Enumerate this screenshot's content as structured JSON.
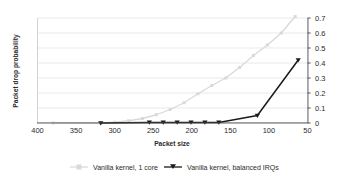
{
  "chart_data": {
    "type": "line",
    "title": "",
    "xlabel": "Packet size",
    "ylabel": "Packet drop probability",
    "xlim": [
      400,
      50
    ],
    "ylim": [
      0,
      0.7
    ],
    "x_ticks": [
      "400",
      "350",
      "300",
      "250",
      "200",
      "150",
      "100",
      "50"
    ],
    "x_tick_values": [
      400,
      350,
      300,
      250,
      200,
      150,
      100,
      50
    ],
    "y_ticks": [
      "0",
      "0.1",
      "0.2",
      "0.3",
      "0.4",
      "0.5",
      "0.6",
      "0.7"
    ],
    "y_tick_values": [
      0,
      0.1,
      0.2,
      0.3,
      0.4,
      0.5,
      0.6,
      0.7
    ],
    "x_axis_reversed": true,
    "y_axis_position": "right",
    "grid": "horizontal",
    "legend_position": "bottom",
    "series": [
      {
        "name": "Vanilla kernel, 1 core",
        "color": "#d9d9d9",
        "marker": "square",
        "x": [
          380,
          318,
          300,
          282,
          264,
          246,
          228,
          210,
          192,
          174,
          156,
          138,
          120,
          102,
          84,
          66
        ],
        "values": [
          0.0,
          0.0,
          0.005,
          0.015,
          0.03,
          0.055,
          0.09,
          0.135,
          0.195,
          0.25,
          0.3,
          0.37,
          0.45,
          0.52,
          0.6,
          0.71
        ]
      },
      {
        "name": "Vanilla kernel, balanced IRQs",
        "color": "#1a1a1a",
        "marker": "triangle",
        "x": [
          318,
          255,
          237,
          219,
          201,
          183,
          165,
          115,
          62
        ],
        "values": [
          0.0,
          0.004,
          0.004,
          0.004,
          0.004,
          0.004,
          0.004,
          0.05,
          0.42
        ]
      }
    ]
  },
  "legend": {
    "items": [
      {
        "label": "Vanilla kernel, 1 core"
      },
      {
        "label": "Vanilla kernel, balanced IRQs"
      }
    ]
  }
}
